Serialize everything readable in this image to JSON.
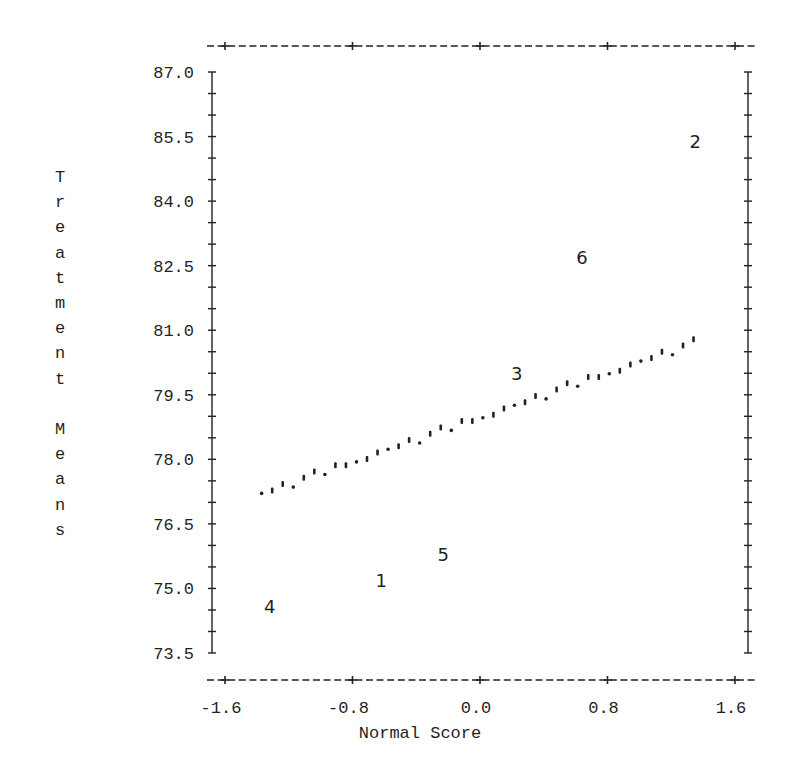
{
  "chart_data": {
    "type": "scatter",
    "title": "",
    "xlabel": "Normal Score",
    "ylabel": "Treatment Means",
    "xlim": [
      -1.6,
      1.6
    ],
    "ylim": [
      73.5,
      87.0
    ],
    "x_ticks": [
      "-1.6",
      "-0.8",
      "0.0",
      "0.8",
      "1.6"
    ],
    "y_ticks": [
      "87.0",
      "85.5",
      "84.0",
      "82.5",
      "81.0",
      "79.5",
      "78.0",
      "76.5",
      "75.0",
      "73.5"
    ],
    "grid": false,
    "legend": null,
    "series": [
      {
        "name": "Treatment means (labeled by treatment number)",
        "points": [
          {
            "label": "1",
            "x": -0.62,
            "y": 75.2
          },
          {
            "label": "2",
            "x": 1.35,
            "y": 85.4
          },
          {
            "label": "3",
            "x": 0.23,
            "y": 80.0
          },
          {
            "label": "4",
            "x": -1.32,
            "y": 74.6
          },
          {
            "label": "5",
            "x": -0.23,
            "y": 75.8
          },
          {
            "label": "6",
            "x": 0.64,
            "y": 82.7
          }
        ]
      },
      {
        "name": "Reference line (dotted)",
        "style": "dotted",
        "x": [
          -1.37,
          1.34
        ],
        "y": [
          77.2,
          80.7
        ]
      }
    ]
  },
  "axes": {
    "xlabel": "Normal Score",
    "ylabel_letters": [
      "T",
      "r",
      "e",
      "a",
      "t",
      "m",
      "e",
      "n",
      "t",
      "",
      "M",
      "e",
      "a",
      "n",
      "s"
    ]
  }
}
